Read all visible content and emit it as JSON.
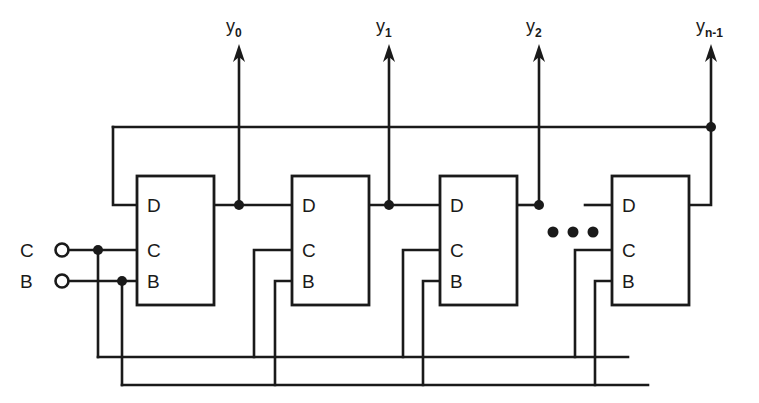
{
  "figure": {
    "background_color": "#ffffff",
    "line_color": "#1a1a1a",
    "width": 759,
    "height": 403
  },
  "inputs": [
    {
      "id": "C",
      "label": "C",
      "terminal": "open-circle",
      "x": 62,
      "y": 250
    },
    {
      "id": "B",
      "label": "B",
      "terminal": "open-circle",
      "x": 62,
      "y": 281
    }
  ],
  "outputs": [
    {
      "id": "y0",
      "label": "y",
      "subscript": "0",
      "x": 239,
      "arrow_top_y": 48,
      "label_x": 226,
      "label_y": 16
    },
    {
      "id": "y1",
      "label": "y",
      "subscript": "1",
      "x": 389,
      "arrow_top_y": 48,
      "label_x": 376,
      "label_y": 16
    },
    {
      "id": "y2",
      "label": "y",
      "subscript": "2",
      "x": 539,
      "arrow_top_y": 48,
      "label_x": 526,
      "label_y": 16
    },
    {
      "id": "yn-1",
      "label": "y",
      "subscript": "n-1",
      "x": 711,
      "arrow_top_y": 48,
      "label_x": 696,
      "label_y": 16
    }
  ],
  "flipflops": [
    {
      "id": "ff0",
      "index": 0,
      "x": 137,
      "y": 176,
      "width": 77,
      "height": 129,
      "pins": [
        {
          "name": "D",
          "label": "D",
          "side": "left",
          "y": 205
        },
        {
          "name": "C",
          "label": "C",
          "side": "left",
          "y": 250
        },
        {
          "name": "B",
          "label": "B",
          "side": "left",
          "y": 281
        }
      ]
    },
    {
      "id": "ff1",
      "index": 1,
      "x": 292,
      "y": 176,
      "width": 77,
      "height": 129,
      "pins": [
        {
          "name": "D",
          "label": "D",
          "side": "left",
          "y": 205
        },
        {
          "name": "C",
          "label": "C",
          "side": "left",
          "y": 250
        },
        {
          "name": "B",
          "label": "B",
          "side": "left",
          "y": 281
        }
      ]
    },
    {
      "id": "ff2",
      "index": 2,
      "x": 440,
      "y": 176,
      "width": 77,
      "height": 129,
      "pins": [
        {
          "name": "D",
          "label": "D",
          "side": "left",
          "y": 205
        },
        {
          "name": "C",
          "label": "C",
          "side": "left",
          "y": 250
        },
        {
          "name": "B",
          "label": "B",
          "side": "left",
          "y": 281
        }
      ]
    },
    {
      "id": "ffn",
      "index": 3,
      "x": 612,
      "y": 176,
      "width": 77,
      "height": 129,
      "pins": [
        {
          "name": "D",
          "label": "D",
          "side": "left",
          "y": 205
        },
        {
          "name": "C",
          "label": "C",
          "side": "left",
          "y": 250
        },
        {
          "name": "B",
          "label": "B",
          "side": "left",
          "y": 281
        }
      ]
    }
  ],
  "ellipsis": {
    "name": "continuation-ellipsis",
    "dots": 3,
    "x_positions": [
      553,
      573,
      593
    ],
    "y": 232,
    "radius": 5
  },
  "buses": {
    "feedback_top": {
      "y": 127,
      "x_start": 113,
      "x_end": 711
    },
    "clock_bus_c": {
      "y": 357,
      "x_start": 98,
      "x_end": 628
    },
    "enable_bus_b": {
      "y": 385,
      "x_start": 122,
      "x_end": 648
    }
  },
  "junction_dots": [
    {
      "name": "c-input-tap",
      "x": 98,
      "y": 250
    },
    {
      "name": "b-input-tap",
      "x": 122,
      "y": 281
    },
    {
      "name": "q0-tap",
      "x": 239,
      "y": 205
    },
    {
      "name": "q1-tap",
      "x": 389,
      "y": 205
    },
    {
      "name": "q2-tap",
      "x": 539,
      "y": 205
    },
    {
      "name": "qn-tap",
      "x": 711,
      "y": 127
    }
  ]
}
